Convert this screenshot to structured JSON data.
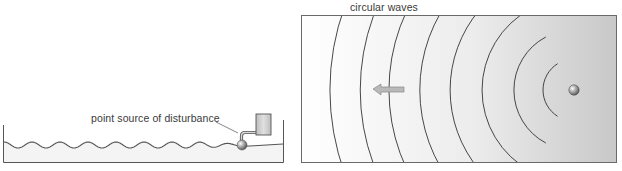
{
  "figure": {
    "left_panel": {
      "name": "ripple-tank-side-view",
      "label": "point source of disturbance",
      "tank": {
        "x0": 3,
        "x1": 284,
        "top_left": 125,
        "top_right": 120,
        "bottom": 162
      },
      "water_surface": {
        "y_mid": 145,
        "amplitude": 3,
        "wavelength": 28,
        "x_start": 4,
        "x_end": 240
      },
      "source_ball": {
        "cx": 242,
        "cy": 145,
        "r": 5
      },
      "vibrator_box": {
        "x": 256,
        "y": 114,
        "w": 15,
        "h": 21
      },
      "colors": {
        "line": "#555555",
        "water": "#f2f2f2",
        "box": "#cfcfcf",
        "ball": "#8a8a8a"
      }
    },
    "right_panel": {
      "name": "ripple-tank-top-view",
      "label": "circular waves",
      "frame": {
        "x": 301,
        "y": 15,
        "w": 316,
        "h": 148
      },
      "source": {
        "cx": 574,
        "cy": 90,
        "r": 5
      },
      "wavefront_radii": [
        244,
        214,
        185,
        154,
        124,
        92,
        60,
        31
      ],
      "arrow": {
        "direction": "left",
        "tip_x": 373,
        "tail_x": 404,
        "y": 89
      },
      "colors": {
        "frame": "#6a6a6a",
        "gradient_left": "#ffffff",
        "gradient_right": "#c8c8c8",
        "wavefront": "#333333",
        "arrow_fill": "#b9b9b9",
        "arrow_stroke": "#888888"
      }
    }
  }
}
